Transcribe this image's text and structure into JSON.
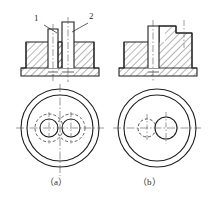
{
  "figure": {
    "type": "engineering-drawing",
    "top_partial_text": "",
    "callouts": [
      {
        "id": "callout-1",
        "text": "1",
        "x": 36,
        "y": 19,
        "leader_from": [
          44,
          25
        ],
        "leader_to": [
          57,
          33
        ]
      },
      {
        "id": "callout-2",
        "text": "2",
        "x": 91,
        "y": 17,
        "leader_from": [
          89,
          23
        ],
        "leader_to": [
          73,
          32
        ]
      }
    ],
    "captions": [
      {
        "id": "caption-a",
        "text": "（a）",
        "x": 48,
        "y": 182
      },
      {
        "id": "caption-b",
        "text": "（b）",
        "x": 141,
        "y": 182
      }
    ],
    "colors": {
      "line": "#1f1f1f",
      "thin_line": "#3a3a3a",
      "hatch": "#2a2a2a",
      "center_line": "#555555",
      "background": "#ffffff"
    },
    "views": {
      "a": {
        "name": "view-a",
        "section": {
          "label": "sectional-view-a",
          "note": "Two separate cylindrical bosses rising from a flanged base, both shown in full section with 45-degree hatching",
          "boss_count": 2
        },
        "plan": {
          "label": "plan-view-a",
          "outer_circles": 2,
          "inner_features": "two equal solid circles each surrounded by a dashed hidden circle",
          "center_x": 60,
          "center_y": 128,
          "outer_radius": 39,
          "inner_ring_radius": 33,
          "hole_radius": 9,
          "hidden_radius": 14,
          "hole_offset": 11
        }
      },
      "b": {
        "name": "view-b",
        "section": {
          "label": "sectional-view-b",
          "note": "One cylindrical boss and one stepped raised block merged into the body, full section with 45-degree hatching",
          "boss_count": 1
        },
        "plan": {
          "label": "plan-view-b",
          "outer_circles": 2,
          "inner_features": "one small dashed hidden circle on the left and one larger solid circle on the right",
          "center_x": 157,
          "center_y": 128,
          "outer_radius": 39,
          "inner_ring_radius": 33,
          "hole_radius": 11,
          "hidden_radius": 9,
          "hole_offset": 10
        }
      }
    }
  }
}
